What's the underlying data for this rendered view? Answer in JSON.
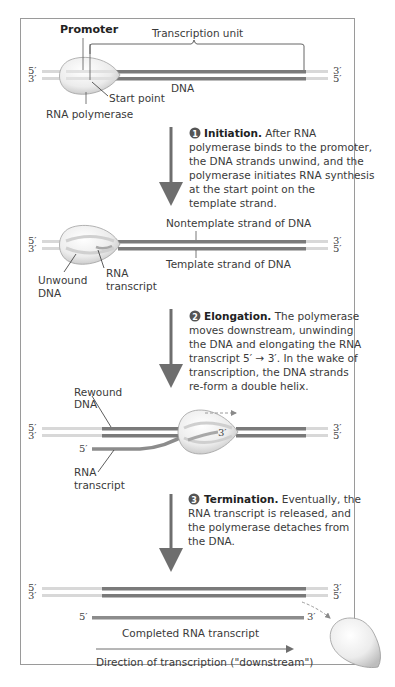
{
  "diagram": {
    "colors": {
      "dna_dark": "#7a7a7a",
      "dna_light": "#d8d8d8",
      "rna": "#8c8c8c",
      "arrow": "#6e6e6e",
      "polymerase": "#e9e9e9",
      "frame": "#9a9a9a"
    },
    "ends": {
      "five_prime": "5′",
      "three_prime": "3′"
    },
    "panel1": {
      "promoter": "Promoter",
      "transcription_unit": "Transcription unit",
      "dna": "DNA",
      "start_point": "Start point",
      "rna_polymerase": "RNA polymerase"
    },
    "step1": {
      "number": "1",
      "title": "Initiation.",
      "lines": [
        " After RNA",
        "polymerase binds to the promoter,",
        "the DNA strands unwind, and the",
        "polymerase initiates RNA synthesis",
        "at the start point on the",
        "template strand."
      ]
    },
    "panel2": {
      "nontemplate": "Nontemplate strand of DNA",
      "template": "Template strand of DNA",
      "unwound_1": "Unwound",
      "unwound_2": "DNA",
      "rna_1": "RNA",
      "rna_2": "transcript"
    },
    "step2": {
      "number": "2",
      "title": "Elongation.",
      "lines": [
        " The polymerase",
        "moves downstream, unwinding",
        "the DNA and elongating the RNA",
        "transcript 5′ → 3′. In the wake of",
        "transcription, the DNA strands",
        "re-form a double helix."
      ]
    },
    "panel3": {
      "rewound_1": "Rewound",
      "rewound_2": "DNA",
      "rna_1": "RNA",
      "rna_2": "transcript",
      "three_prime_inside": "3′"
    },
    "step3": {
      "number": "3",
      "title": "Termination.",
      "lines": [
        " Eventually, the",
        "RNA transcript is released, and",
        "the polymerase detaches from",
        "the DNA."
      ]
    },
    "panel4": {
      "completed": "Completed RNA transcript",
      "direction": "Direction of transcription (\"downstream\")"
    }
  }
}
